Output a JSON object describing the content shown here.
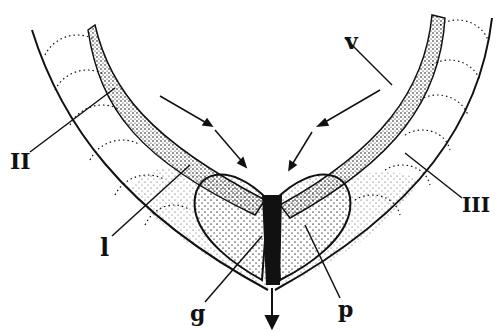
{
  "diagram": {
    "labels": {
      "II": "II",
      "v": "v",
      "I": "l",
      "III": "III",
      "g": "g",
      "p": "p"
    },
    "colors": {
      "ink": "#111111",
      "background": "#ffffff"
    }
  }
}
